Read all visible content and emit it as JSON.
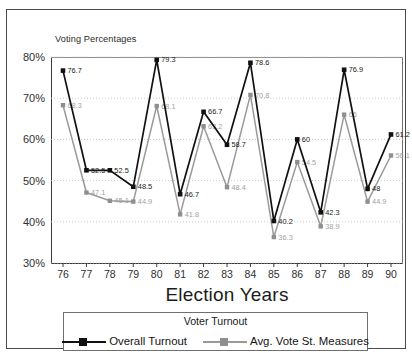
{
  "chart_data": {
    "type": "line",
    "title": "Voting Percentages",
    "xlabel": "Election Years",
    "ylabel": "",
    "categories": [
      "76",
      "77",
      "78",
      "79",
      "80",
      "81",
      "82",
      "83",
      "84",
      "85",
      "86",
      "87",
      "88",
      "89",
      "90"
    ],
    "ylim": [
      30,
      80
    ],
    "yticks": [
      "30%",
      "40%",
      "50%",
      "60%",
      "70%",
      "80%"
    ],
    "ytick_values": [
      30,
      40,
      50,
      60,
      70,
      80
    ],
    "grid": true,
    "legend_position": "bottom",
    "legend_title": "Voter Turnout",
    "series": [
      {
        "name": "Overall Turnout",
        "color": "#111111",
        "values": [
          76.7,
          52.5,
          52.5,
          48.5,
          79.3,
          46.7,
          66.7,
          58.7,
          78.6,
          40.2,
          60,
          42.3,
          76.9,
          48,
          61.2
        ],
        "labels": [
          "76.7",
          "52.5",
          "52.5",
          "48.5",
          "79.3",
          "46.7",
          "66.7",
          "58.7",
          "78.6",
          "40.2",
          "60",
          "42.3",
          "76.9",
          "48",
          "61.2"
        ]
      },
      {
        "name": "Avg. Vote St. Measures",
        "color": "#9a9a9a",
        "values": [
          68.3,
          47.1,
          45.1,
          44.9,
          68.1,
          41.8,
          63.2,
          48.4,
          70.8,
          36.3,
          54.5,
          38.9,
          66,
          44.9,
          56.1
        ],
        "labels": [
          "68.3",
          "47.1",
          "45.1",
          "44.9",
          "68.1",
          "41.8",
          "63.2",
          "48.4",
          "70.8",
          "36.3",
          "54.5",
          "38.9",
          "66",
          "44.9",
          "56.1"
        ]
      }
    ]
  },
  "caption": {
    "text": ""
  }
}
